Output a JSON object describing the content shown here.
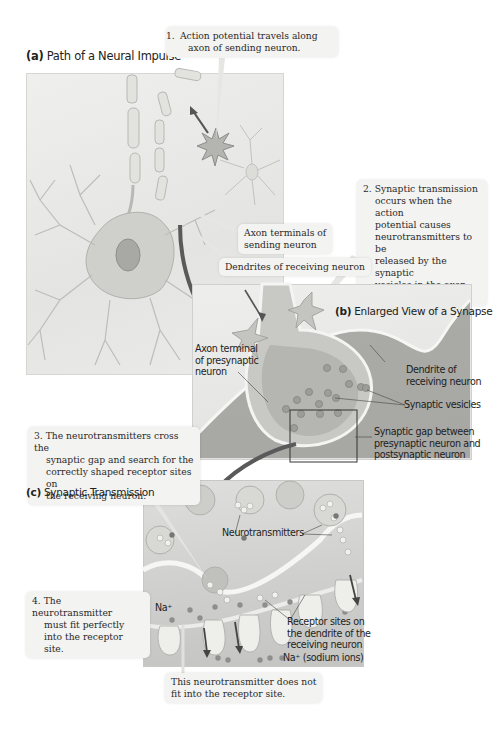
{
  "panels": {
    "a": {
      "letter": "(a)",
      "title": "Path of a Neural Impulse"
    },
    "b": {
      "letter": "(b)",
      "title": "Enlarged View of a Synapse"
    },
    "c": {
      "letter": "(c)",
      "title": "Synaptic Transmission"
    }
  },
  "callouts": {
    "step1": {
      "num": "1.",
      "lines": [
        "Action potential travels along",
        "axon of sending neuron."
      ]
    },
    "step2": {
      "num": "2.",
      "lines": [
        "Synaptic transmission",
        "occurs when the action",
        "potential causes",
        "neurotransmitters to be",
        "released by the synaptic",
        "vesicles in the axon",
        "terminals."
      ]
    },
    "step3": {
      "num": "3.",
      "lines": [
        "The neurotransmitters cross the",
        "synaptic gap and search for the",
        "correctly shaped receptor sites on",
        "the receiving neuron."
      ]
    },
    "step4": {
      "num": "4.",
      "lines": [
        "The neurotransmitter",
        "must fit perfectly",
        "into the receptor site."
      ]
    },
    "axon_terminals": {
      "lines": [
        "Axon terminals of",
        "sending neuron"
      ]
    },
    "dendrites": {
      "lines": [
        "Dendrites of receiving neuron"
      ]
    },
    "no_fit": {
      "lines": [
        "This neurotransmitter does not",
        "fit into the receptor site."
      ]
    }
  },
  "labels": {
    "axon_terminal_pre": [
      "Axon terminal",
      "of presynaptic",
      "neuron"
    ],
    "dendrite_receiving": [
      "Dendrite of",
      "receiving neuron"
    ],
    "synaptic_vesicles": [
      "Synaptic vesicles"
    ],
    "synaptic_gap": [
      "Synaptic gap between",
      "presynaptic neuron and",
      "postsynaptic neuron"
    ],
    "neurotransmitters": [
      "Neurotransmitters"
    ],
    "na_plus": "Na⁺",
    "receptor_sites": [
      "Receptor sites on",
      "the dendrite of the",
      "receiving neuron"
    ],
    "sodium_ions": "Na⁺ (sodium ions)"
  },
  "colors": {
    "panel_bg": "#e9e9e7",
    "ink": "#222222",
    "arrow": "#555555",
    "callout_bg": "#f3f3f1",
    "vesicle": "#b9b9b5",
    "ion": "#8a8a88"
  }
}
